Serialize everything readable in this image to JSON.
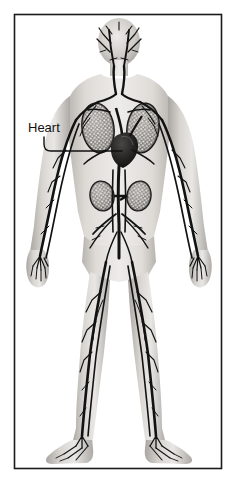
{
  "figure": {
    "name": "human-circulatory-system-diagram",
    "style": "grayscale anatomical illustration",
    "frame": {
      "border_color": "#1a1a1a",
      "background_color": "#ffffff",
      "x": 14,
      "y": 14,
      "width": 208,
      "height": 455
    },
    "body_colors": {
      "skin_light": "#e8e6e3",
      "skin_mid": "#c9c6c2",
      "skin_shadow": "#a8a5a1",
      "vessel_dark": "#161616",
      "vessel_mid": "#3d3d3d",
      "organ_fill": "#8f8c88",
      "organ_stipple": "#f2f1ef"
    },
    "labels": [
      {
        "id": "heart",
        "text": "Heart",
        "text_x": 28,
        "text_y": 132,
        "color": "#111111",
        "leader": {
          "from_x": 44,
          "from_y": 137,
          "elbow_x": 44,
          "elbow_y": 144,
          "to_x": 122,
          "to_y": 151
        }
      }
    ],
    "structures": [
      {
        "name": "head",
        "label": "Head"
      },
      {
        "name": "neck",
        "label": "Neck"
      },
      {
        "name": "left-lung",
        "label": "Left lung"
      },
      {
        "name": "right-lung",
        "label": "Right lung"
      },
      {
        "name": "heart",
        "label": "Heart"
      },
      {
        "name": "left-kidney",
        "label": "Left kidney"
      },
      {
        "name": "right-kidney",
        "label": "Right kidney"
      },
      {
        "name": "left-arm",
        "label": "Left arm"
      },
      {
        "name": "right-arm",
        "label": "Right arm"
      },
      {
        "name": "left-hand",
        "label": "Left hand"
      },
      {
        "name": "right-hand",
        "label": "Right hand"
      },
      {
        "name": "left-leg",
        "label": "Left leg"
      },
      {
        "name": "right-leg",
        "label": "Right leg"
      },
      {
        "name": "left-foot",
        "label": "Left foot"
      },
      {
        "name": "right-foot",
        "label": "Right foot"
      }
    ]
  }
}
